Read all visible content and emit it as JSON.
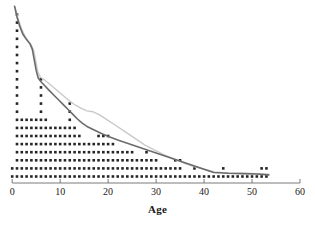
{
  "chart_data": {
    "type": "bar",
    "subtype": "dot-plot-with-overlaid-curves",
    "title": "",
    "subtitle": "",
    "xlabel": "Age",
    "ylabel": "",
    "xlim": [
      0,
      60
    ],
    "ylim": [
      0,
      22
    ],
    "xticks": [
      0,
      10,
      20,
      30,
      40,
      50,
      60
    ],
    "xticklabels": [
      "0",
      "10",
      "20",
      "30",
      "40",
      "50",
      "60"
    ],
    "yticks": [],
    "yticklabels": [],
    "grid": false,
    "legend": null,
    "annotations": [],
    "dot_plot": {
      "description": "Each dot represents one observation; dots stack vertically at each integer Age value.",
      "dot_color": "#262626",
      "dot_diameter_px": 2.6,
      "x_step_units": 1,
      "row_spacing_px": 8.1,
      "baseline_y_px": 176.5,
      "categories": [
        0,
        1,
        2,
        3,
        4,
        5,
        6,
        7,
        8,
        9,
        10,
        11,
        12,
        13,
        14,
        15,
        16,
        17,
        18,
        19,
        20,
        21,
        22,
        23,
        24,
        25,
        26,
        27,
        28,
        29,
        30,
        31,
        32,
        33,
        34,
        35,
        36,
        37,
        38,
        39,
        40,
        41,
        42,
        43,
        44,
        45,
        46,
        47,
        48,
        49,
        50,
        51,
        52,
        53
      ],
      "counts": [
        2,
        21,
        8,
        8,
        8,
        8,
        13,
        8,
        7,
        7,
        7,
        7,
        10,
        7,
        6,
        5,
        5,
        5,
        6,
        6,
        6,
        5,
        4,
        4,
        4,
        4,
        3,
        3,
        4,
        3,
        3,
        2,
        2,
        2,
        3,
        3,
        1,
        1,
        2,
        1,
        1,
        1,
        1,
        1,
        2,
        1,
        1,
        1,
        1,
        1,
        1,
        1,
        2,
        2
      ]
    },
    "curves": [
      {
        "name": "primary-curve",
        "color": "#6b6b6b",
        "width_px": 1.6,
        "points": [
          [
            0.5,
            21.5
          ],
          [
            1.0,
            20.2
          ],
          [
            1.6,
            19.0
          ],
          [
            2.2,
            18.1
          ],
          [
            3.0,
            17.4
          ],
          [
            3.7,
            16.9
          ],
          [
            4.2,
            16.2
          ],
          [
            4.6,
            14.9
          ],
          [
            5.0,
            13.6
          ],
          [
            5.4,
            12.7
          ],
          [
            6.0,
            12.2
          ],
          [
            6.8,
            11.7
          ],
          [
            7.6,
            11.2
          ],
          [
            8.6,
            10.6
          ],
          [
            9.6,
            10.0
          ],
          [
            10.6,
            9.4
          ],
          [
            11.6,
            8.8
          ],
          [
            12.6,
            8.2
          ],
          [
            13.6,
            7.6
          ],
          [
            14.6,
            7.1
          ],
          [
            15.8,
            6.6
          ],
          [
            17.2,
            6.2
          ],
          [
            18.6,
            5.8
          ],
          [
            20.2,
            5.4
          ],
          [
            22.0,
            5.0
          ],
          [
            24.0,
            4.6
          ],
          [
            26.0,
            4.2
          ],
          [
            28.0,
            3.8
          ],
          [
            30.0,
            3.4
          ],
          [
            32.0,
            3.0
          ],
          [
            34.0,
            2.6
          ],
          [
            36.0,
            2.2
          ],
          [
            38.0,
            1.8
          ],
          [
            40.0,
            1.4
          ],
          [
            42.0,
            1.0
          ],
          [
            45.0,
            0.9
          ],
          [
            48.0,
            0.85
          ],
          [
            51.0,
            0.8
          ],
          [
            53.5,
            0.7
          ]
        ]
      },
      {
        "name": "secondary-curve",
        "color": "#c9c9c9",
        "width_px": 1.4,
        "points": [
          [
            0.6,
            21.4
          ],
          [
            1.2,
            20.0
          ],
          [
            1.9,
            18.8
          ],
          [
            2.6,
            17.9
          ],
          [
            3.3,
            17.2
          ],
          [
            4.0,
            16.7
          ],
          [
            4.5,
            16.0
          ],
          [
            4.9,
            14.8
          ],
          [
            5.3,
            13.5
          ],
          [
            5.8,
            12.8
          ],
          [
            6.5,
            12.5
          ],
          [
            7.4,
            12.1
          ],
          [
            8.4,
            11.6
          ],
          [
            9.6,
            11.0
          ],
          [
            10.8,
            10.4
          ],
          [
            12.0,
            9.8
          ],
          [
            13.2,
            9.3
          ],
          [
            14.4,
            8.9
          ],
          [
            15.6,
            8.6
          ],
          [
            16.8,
            8.5
          ],
          [
            18.2,
            8.1
          ],
          [
            19.8,
            7.5
          ],
          [
            21.6,
            6.8
          ],
          [
            23.6,
            6.0
          ],
          [
            25.6,
            5.2
          ],
          [
            27.6,
            4.4
          ],
          [
            29.6,
            3.8
          ],
          [
            31.6,
            3.2
          ],
          [
            33.6,
            2.7
          ],
          [
            35.6,
            2.2
          ],
          [
            37.6,
            1.8
          ],
          [
            40.0,
            1.4
          ],
          [
            42.2,
            1.05
          ],
          [
            45.0,
            0.95
          ],
          [
            48.0,
            0.9
          ],
          [
            51.0,
            0.85
          ],
          [
            53.5,
            0.75
          ]
        ]
      }
    ],
    "axis": {
      "color": "#7a7a7a",
      "line_y_px": 183,
      "tick_length_px": 4
    }
  }
}
